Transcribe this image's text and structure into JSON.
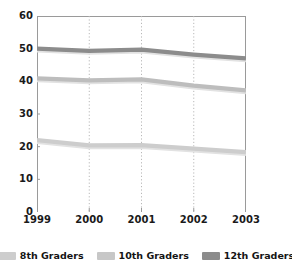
{
  "chart_data": {
    "type": "line",
    "title": "",
    "subtitle": "",
    "xlabel": "",
    "ylabel": "",
    "categories": [
      "1999",
      "2000",
      "2001",
      "2002",
      "2003"
    ],
    "x_tick_labels": [
      "1999",
      "2000",
      "2001",
      "2002",
      "2003"
    ],
    "y_tick_labels": [
      "0",
      "10",
      "20",
      "30",
      "40",
      "50",
      "60"
    ],
    "ylim": [
      0,
      60
    ],
    "ytick_step": 10,
    "grid": "vertical-dotted",
    "legend_position": "bottom",
    "series": [
      {
        "name": "8th Graders",
        "color": "#cdcdcd",
        "values": [
          22.0,
          20.4,
          20.5,
          19.4,
          18.3
        ]
      },
      {
        "name": "10th Graders",
        "color": "#bdbdbd",
        "values": [
          40.9,
          40.3,
          40.6,
          38.7,
          37.2
        ]
      },
      {
        "name": "12th Graders",
        "color": "#8c8c8c",
        "values": [
          50.0,
          49.3,
          49.7,
          48.2,
          47.0
        ]
      }
    ]
  },
  "axis": {
    "y_ticks": [
      {
        "label": "60",
        "value": 60
      },
      {
        "label": "50",
        "value": 50
      },
      {
        "label": "40",
        "value": 40
      },
      {
        "label": "30",
        "value": 30
      },
      {
        "label": "20",
        "value": 20
      },
      {
        "label": "10",
        "value": 10
      },
      {
        "label": "0",
        "value": 0
      }
    ],
    "x_ticks": [
      {
        "label": "1999",
        "value": 1999
      },
      {
        "label": "2000",
        "value": 2000
      },
      {
        "label": "2001",
        "value": 2001
      },
      {
        "label": "2002",
        "value": 2002
      },
      {
        "label": "2003",
        "value": 2003
      }
    ]
  },
  "legend": {
    "items": [
      {
        "label": "8th Graders",
        "color": "#cdcdcd"
      },
      {
        "label": "10th Graders",
        "color": "#c7c7c7"
      },
      {
        "label": "12th Graders",
        "color": "#8c8c8c"
      }
    ]
  },
  "colors": {
    "axis_line": "#9a9a9a",
    "gridline": "#b8b8b8",
    "text": "#1a1a1a",
    "background": "#ffffff"
  }
}
